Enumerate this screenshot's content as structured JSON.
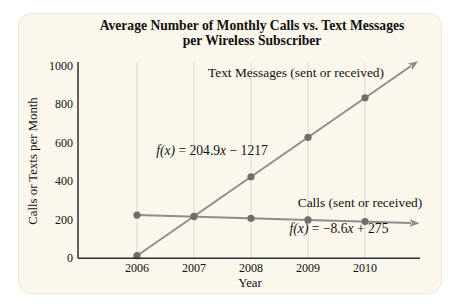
{
  "title": {
    "line1": "Average Number of Monthly Calls vs. Text Messages",
    "line2": "per Wireless Subscriber"
  },
  "axes": {
    "y_label": "Calls or Texts per Month",
    "x_label": "Year",
    "y_ticks": [
      "1000",
      "800",
      "600",
      "400",
      "200",
      "0"
    ]
  },
  "annotations": {
    "texts_label": "Text Messages (sent or received)",
    "calls_label": "Calls (sent or received)",
    "texts_equation": {
      "f": "f(x)",
      "pre": " = 204.9",
      "x": "x",
      "post": " − 1217"
    },
    "calls_equation": {
      "f": "f(x)",
      "pre": " = −8.6",
      "x": "x",
      "post": " + 275"
    }
  },
  "chart_data": {
    "type": "line",
    "categories": [
      "2006",
      "2007",
      "2008",
      "2009",
      "2010"
    ],
    "series": [
      {
        "name": "Text Messages (sent or received)",
        "values": [
          12,
          217,
          422,
          627,
          832
        ],
        "equation": "f(x) = 204.9x − 1217"
      },
      {
        "name": "Calls (sent or received)",
        "values": [
          223,
          215,
          206,
          198,
          189
        ],
        "equation": "f(x) = −8.6x + 275"
      }
    ],
    "title": "Average Number of Monthly Calls vs. Text Messages per Wireless Subscriber",
    "xlabel": "Year",
    "ylabel": "Calls or Texts per Month",
    "ylim": [
      0,
      1000
    ],
    "grid": "vertical-gridlines-per-year",
    "legend": "inline-annotations-with-arrows"
  },
  "colors": {
    "card_bg": "#fbf7ec",
    "card_border": "#ebe6d7",
    "line": "#8f8d8d",
    "dot": "#6f6d6d",
    "grid": "#dcd8cc",
    "axis": "#2e2e2e",
    "text": "#111111"
  }
}
